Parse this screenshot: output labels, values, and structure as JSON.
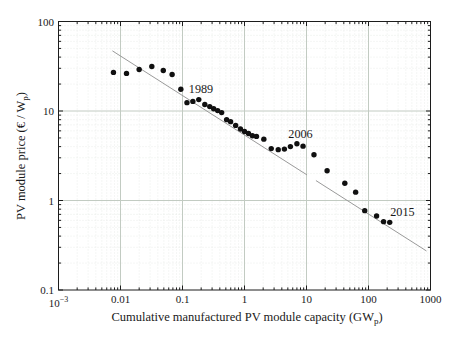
{
  "figure": {
    "xlabel": {
      "main": "Cumulative manufactured PV module capacity (GW",
      "sub": "p",
      "close": ")"
    },
    "ylabel": {
      "main": "PV module price (€ / W",
      "sub": "p",
      "close": ")"
    }
  },
  "chart_data": {
    "type": "scatter",
    "title": "",
    "xlabel": "Cumulative manufactured PV module capacity (GWp)",
    "ylabel": "PV module price (€ / Wp)",
    "x_scale": "log",
    "y_scale": "log",
    "xlim": [
      0.001,
      1000
    ],
    "ylim": [
      0.1,
      100
    ],
    "grid": "major solid + faint dotted minor",
    "legend": "none",
    "x_ticks": [
      {
        "value": 0.001,
        "label": "10",
        "sup": "−3"
      },
      {
        "value": 0.01,
        "label": "0.01"
      },
      {
        "value": 0.1,
        "label": "0.1"
      },
      {
        "value": 1,
        "label": "1"
      },
      {
        "value": 10,
        "label": "10"
      },
      {
        "value": 100,
        "label": "100"
      },
      {
        "value": 1000,
        "label": "1000"
      }
    ],
    "y_ticks": [
      {
        "value": 0.1,
        "label": "0.1"
      },
      {
        "value": 1,
        "label": "1"
      },
      {
        "value": 10,
        "label": "10"
      },
      {
        "value": 100,
        "label": "100"
      }
    ],
    "points": [
      [
        0.0077,
        27.0
      ],
      [
        0.0125,
        26.3
      ],
      [
        0.02,
        29.1
      ],
      [
        0.032,
        31.4
      ],
      [
        0.049,
        28.3
      ],
      [
        0.068,
        25.6
      ],
      [
        0.094,
        17.5
      ],
      [
        0.118,
        12.4
      ],
      [
        0.147,
        12.8
      ],
      [
        0.183,
        13.4
      ],
      [
        0.229,
        11.8
      ],
      [
        0.275,
        11.2
      ],
      [
        0.318,
        10.6
      ],
      [
        0.369,
        10.1
      ],
      [
        0.428,
        9.6
      ],
      [
        0.515,
        8.0
      ],
      [
        0.597,
        7.6
      ],
      [
        0.72,
        6.9
      ],
      [
        0.86,
        6.3
      ],
      [
        1.0,
        5.9
      ],
      [
        1.16,
        5.6
      ],
      [
        1.34,
        5.3
      ],
      [
        1.56,
        5.2
      ],
      [
        2.05,
        4.85
      ],
      [
        2.7,
        3.8
      ],
      [
        3.5,
        3.7
      ],
      [
        4.4,
        3.75
      ],
      [
        5.5,
        4.0
      ],
      [
        7.0,
        4.3
      ],
      [
        8.8,
        4.05
      ],
      [
        13.2,
        3.25
      ],
      [
        21.5,
        2.15
      ],
      [
        41.5,
        1.56
      ],
      [
        62,
        1.24
      ],
      [
        87,
        0.77
      ],
      [
        135,
        0.67
      ],
      [
        175,
        0.58
      ],
      [
        220,
        0.57
      ]
    ],
    "trendline": {
      "color": "#9a9a9a",
      "segments": [
        [
          0.0074,
          47.0,
          10.2,
          1.93
        ],
        [
          14.2,
          1.67,
          860,
          0.273
        ]
      ]
    },
    "annotations": [
      {
        "label": "1989",
        "x": 0.199,
        "y": 17.4
      },
      {
        "label": "2006",
        "x": 8.0,
        "y": 5.5
      },
      {
        "label": "2015",
        "x": 353,
        "y": 0.74
      }
    ],
    "colors": {
      "marker": "#101010",
      "frame": "#1c1c1c",
      "grid_major": "#c2cbc2",
      "grid_minor": "#e5e9e5",
      "text": "#1a1a1a"
    },
    "marker": {
      "shape": "circle",
      "radius": 2.7
    }
  }
}
